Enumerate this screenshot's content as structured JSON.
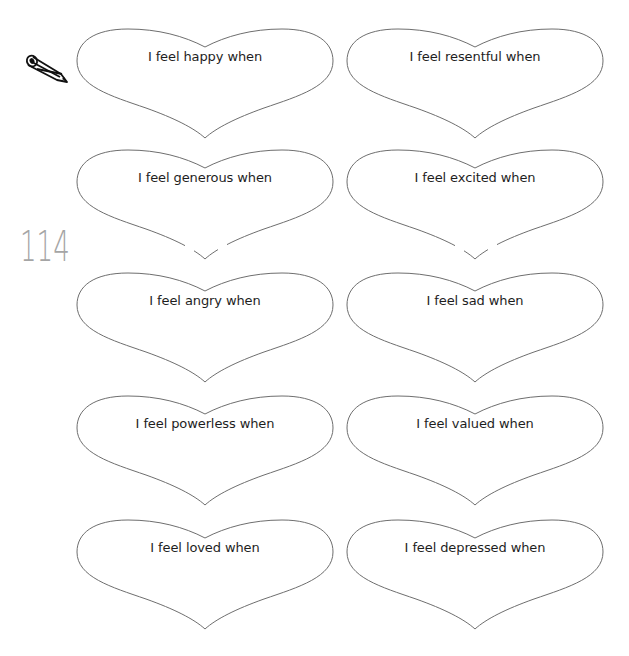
{
  "page": {
    "page_number": "114",
    "icon": "pencil-icon",
    "outline_color": "#6e6e6e",
    "text_color": "#1e1e1e"
  },
  "hearts": [
    {
      "label": "I feel happy when"
    },
    {
      "label": "I feel resentful when"
    },
    {
      "label": "I feel generous when"
    },
    {
      "label": "I feel excited when"
    },
    {
      "label": "I feel angry when"
    },
    {
      "label": "I feel sad when"
    },
    {
      "label": "I feel powerless when"
    },
    {
      "label": "I feel valued when"
    },
    {
      "label": "I feel loved when"
    },
    {
      "label": "I feel depressed when"
    }
  ]
}
